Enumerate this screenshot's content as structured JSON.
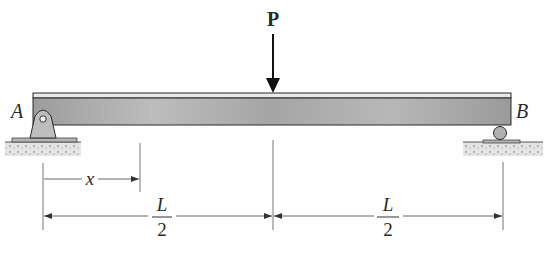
{
  "diagram": {
    "type": "simply-supported-beam",
    "load": {
      "label": "P",
      "position": "midspan",
      "direction": "down"
    },
    "supports": [
      {
        "label": "A",
        "type": "pin",
        "side": "left"
      },
      {
        "label": "B",
        "type": "roller",
        "side": "right"
      }
    ],
    "dimensions": {
      "x_label": "x",
      "half_span_left": {
        "numerator": "L",
        "denominator": "2"
      },
      "half_span_right": {
        "numerator": "L",
        "denominator": "2"
      }
    }
  },
  "colors": {
    "beam_fill": "#a9a9a9",
    "beam_flange": "#e6e6e6",
    "support_fill": "#bdbdbd",
    "ground_fill": "#d9d9d9",
    "line": "#2a2a2a",
    "dim_line": "#555555"
  }
}
